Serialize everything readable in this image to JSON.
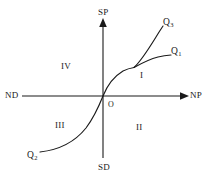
{
  "diagram": {
    "background_color": "#ffffff",
    "stroke_color": "#1a1a1a",
    "axes": {
      "vertical_positive_label": "SP",
      "vertical_negative_label": "SD",
      "horizontal_negative_label": "ND",
      "horizontal_positive_label": "NP",
      "origin_label": "O"
    },
    "quadrants": [
      {
        "id": "quadrant-1",
        "label": "I"
      },
      {
        "id": "quadrant-2",
        "label": "II"
      },
      {
        "id": "quadrant-3",
        "label": "III"
      },
      {
        "id": "quadrant-4",
        "label": "IV"
      }
    ],
    "curve_labels": [
      {
        "id": "curve-q1",
        "base": "Q",
        "sub": "1"
      },
      {
        "id": "curve-q2",
        "base": "Q",
        "sub": "2"
      },
      {
        "id": "curve-q3",
        "base": "Q",
        "sub": "3"
      }
    ]
  }
}
